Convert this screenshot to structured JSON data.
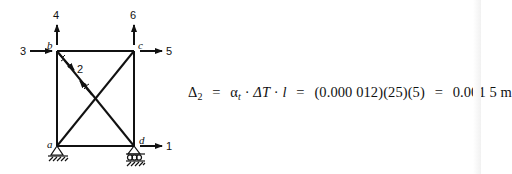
{
  "diagram": {
    "type": "truss-frame",
    "nodes": [
      {
        "id": "a",
        "label": "a"
      },
      {
        "id": "b",
        "label": "b"
      },
      {
        "id": "c",
        "label": "c"
      },
      {
        "id": "d",
        "label": "d"
      }
    ],
    "dof_labels": [
      "1",
      "2",
      "3",
      "4",
      "5",
      "6"
    ],
    "supports": [
      {
        "node": "a",
        "type": "pin"
      },
      {
        "node": "d",
        "type": "roller"
      }
    ]
  },
  "equation": {
    "lhs": "Δ",
    "lhs_sub": "2",
    "eq1": "=",
    "alpha": "α",
    "alpha_sub": "t",
    "dot1": "·",
    "dT": "ΔT",
    "dot2": "·",
    "l": "l",
    "eq2": "=",
    "values": "(0.000 012)(25)(5)",
    "eq3": "=",
    "result": "0.001 5 m"
  },
  "colors": {
    "ink": "#111111",
    "background": "#ffffff"
  }
}
